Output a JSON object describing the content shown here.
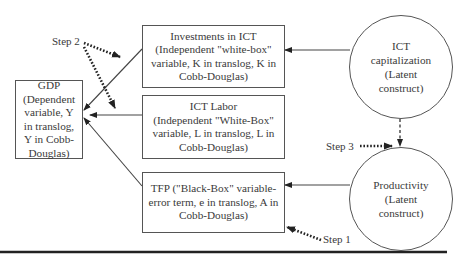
{
  "nodes": {
    "gdp": {
      "lines": [
        "GDP",
        "(Dependent",
        "variable, Y",
        "in translog,",
        "Y in Cobb-",
        "Douglas)"
      ]
    },
    "investments": {
      "lines": [
        "Investments in ICT",
        "(Independent \"white-box\"",
        "variable, K in translog, K in",
        "Cobb-Douglas)"
      ]
    },
    "ict_labor": {
      "lines": [
        "ICT Labor",
        "(Independent \"White-Box\"",
        "variable, L in translog, L in",
        "Cobb-Douglas)"
      ]
    },
    "tfp": {
      "lines": [
        "TFP (\"Black-Box\" variable-",
        "error term, e in translog, A in",
        "Cobb-Douglas)"
      ]
    },
    "ict_capitalization": {
      "lines": [
        "ICT",
        "capitalization",
        "(Latent",
        "construct)"
      ]
    },
    "productivity": {
      "lines": [
        "Productivity",
        "(Latent",
        "construct)"
      ]
    }
  },
  "steps": {
    "step1": "Step 1",
    "step2": "Step 2",
    "step3": "Step 3"
  },
  "colors": {
    "stroke": "#555555",
    "text": "#3a3a3a",
    "arrow": "#222222"
  }
}
